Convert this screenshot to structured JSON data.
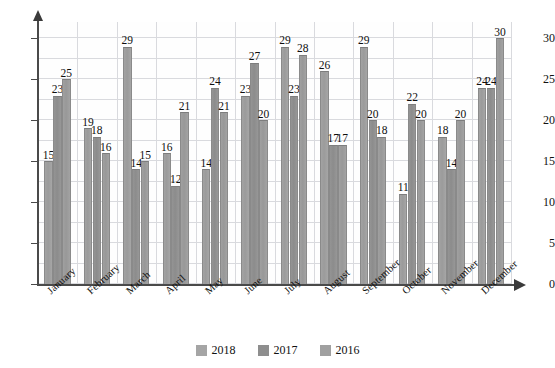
{
  "title_strip": "",
  "chart_data": {
    "type": "bar",
    "title": "",
    "subtitle": "",
    "xlabel": "",
    "ylabel": "",
    "ylim": [
      0,
      32
    ],
    "yticks": [
      0,
      5,
      10,
      15,
      20,
      25,
      30
    ],
    "grid": true,
    "legend_position": "bottom",
    "categories": [
      "January",
      "February",
      "March",
      "April",
      "May",
      "June",
      "July",
      "August",
      "September",
      "October",
      "November",
      "December"
    ],
    "series": [
      {
        "name": "2018",
        "color": "#9f9f9f",
        "values": [
          15,
          19,
          29,
          16,
          14,
          23,
          29,
          26,
          29,
          11,
          18,
          24
        ]
      },
      {
        "name": "2017",
        "color": "#909090",
        "values": [
          23,
          18,
          14,
          12,
          24,
          27,
          23,
          17,
          20,
          22,
          14,
          24
        ]
      },
      {
        "name": "2016",
        "color": "#9c9c9c",
        "values": [
          25,
          16,
          15,
          21,
          21,
          20,
          28,
          17,
          18,
          20,
          20,
          30
        ]
      }
    ],
    "data_labels_shown": true
  },
  "axis": {
    "y_tick_labels": [
      "0",
      "5",
      "10",
      "15",
      "20",
      "25",
      "30"
    ],
    "x_tick_labels": [
      "January",
      "February",
      "March",
      "April",
      "May",
      "June",
      "July",
      "August",
      "September",
      "October",
      "November",
      "December"
    ]
  },
  "legend": {
    "items": [
      {
        "label": "2018",
        "color": "#a5a5a5"
      },
      {
        "label": "2017",
        "color": "#8e8e8e"
      },
      {
        "label": "2016",
        "color": "#a0a0a0"
      }
    ]
  }
}
